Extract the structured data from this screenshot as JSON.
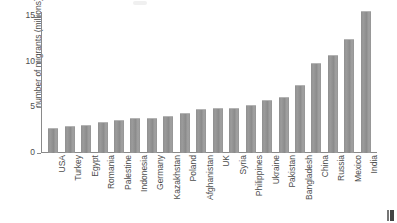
{
  "chart_data": {
    "type": "bar",
    "title": "",
    "subtitle": "",
    "xlabel": "",
    "ylabel": "number of migrants (millions)",
    "ylim": [
      0,
      15.5
    ],
    "yticks": [
      0,
      5,
      10,
      15
    ],
    "ytick_labels": [
      "0",
      "5",
      "10",
      "15"
    ],
    "grid": false,
    "legend": null,
    "bar_color": "#909090",
    "axis_color": "#8a8a8a",
    "text_color": "#4d4d4d",
    "categories": [
      "USA",
      "Turkey",
      "Egypt",
      "Romania",
      "Palestine",
      "Indonesia",
      "Germany",
      "Kazakhstan",
      "Poland",
      "Afghanistan",
      "UK",
      "Syria",
      "Philippines",
      "Ukraine",
      "Pakistan",
      "Bangladesh",
      "China",
      "Russia",
      "Mexico",
      "India"
    ],
    "values": [
      2.8,
      3.0,
      3.1,
      3.4,
      3.6,
      3.8,
      3.9,
      4.1,
      4.4,
      4.8,
      4.9,
      5.0,
      5.3,
      5.8,
      6.2,
      7.5,
      9.9,
      10.8,
      12.5,
      15.6
    ],
    "units": "millions"
  }
}
